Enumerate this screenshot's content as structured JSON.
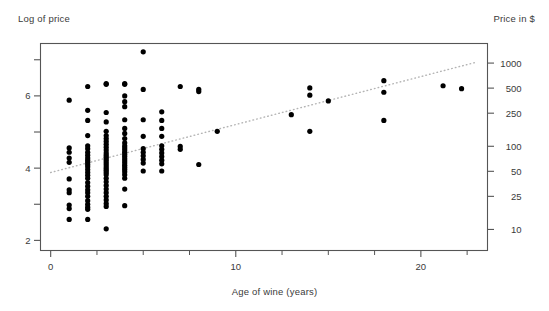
{
  "titles": {
    "left_axis_title": "Log of price",
    "right_axis_title": "Price in $",
    "x_axis_title": "Age of wine (years)"
  },
  "chart_data": {
    "type": "scatter",
    "title": "",
    "xlabel": "Age of wine (years)",
    "ylabel": "Log of price",
    "y2label": "Price in $",
    "xlim": [
      -0.55,
      23.6
    ],
    "ylim": [
      1.72,
      7.45
    ],
    "grid": false,
    "legend": "none",
    "xticks": [
      0,
      10,
      20
    ],
    "xtick_labels": [
      "0",
      "10",
      "20"
    ],
    "xticks_minor": [
      2.5,
      5,
      7.5,
      12.5,
      15,
      17.5,
      22.5
    ],
    "yticks": [
      2,
      3,
      4,
      5,
      6,
      7
    ],
    "ytick_labels": [
      "2",
      "",
      "4",
      "",
      "6",
      ""
    ],
    "y2ticks_log": [
      2.303,
      3.219,
      3.912,
      4.605,
      5.521,
      6.215,
      6.908
    ],
    "y2tick_labels": [
      "10",
      "25",
      "50",
      "100",
      "250",
      "500",
      "1000"
    ],
    "marker": "filled-circle",
    "marker_color": "#000000",
    "marker_size_px": 2.6,
    "trendline": {
      "style": "dotted",
      "color": "#b4b4b4",
      "x_start": 0.0,
      "y_start": 3.88,
      "x_end": 22.9,
      "y_end": 6.92
    },
    "points": [
      [
        1.0,
        5.88
      ],
      [
        1.0,
        4.56
      ],
      [
        1.0,
        4.44
      ],
      [
        1.0,
        4.28
      ],
      [
        1.0,
        4.16
      ],
      [
        1.0,
        3.7
      ],
      [
        1.0,
        3.4
      ],
      [
        1.0,
        3.32
      ],
      [
        1.0,
        2.98
      ],
      [
        1.0,
        2.88
      ],
      [
        1.0,
        2.58
      ],
      [
        2.0,
        6.26
      ],
      [
        2.0,
        5.6
      ],
      [
        2.0,
        5.32
      ],
      [
        2.0,
        4.9
      ],
      [
        2.0,
        4.62
      ],
      [
        2.0,
        4.54
      ],
      [
        2.0,
        4.44
      ],
      [
        2.0,
        4.36
      ],
      [
        2.0,
        4.28
      ],
      [
        2.0,
        4.22
      ],
      [
        2.0,
        4.16
      ],
      [
        2.0,
        4.1
      ],
      [
        2.0,
        4.04
      ],
      [
        2.0,
        3.96
      ],
      [
        2.0,
        3.88
      ],
      [
        2.0,
        3.8
      ],
      [
        2.0,
        3.72
      ],
      [
        2.0,
        3.6
      ],
      [
        2.0,
        3.5
      ],
      [
        2.0,
        3.4
      ],
      [
        2.0,
        3.32
      ],
      [
        2.0,
        3.22
      ],
      [
        2.0,
        3.1
      ],
      [
        2.0,
        3.0
      ],
      [
        2.0,
        2.92
      ],
      [
        2.0,
        2.86
      ],
      [
        2.0,
        2.58
      ],
      [
        3.0,
        6.34
      ],
      [
        3.0,
        6.32
      ],
      [
        3.0,
        5.54
      ],
      [
        3.0,
        5.28
      ],
      [
        3.0,
        5.02
      ],
      [
        3.0,
        4.9
      ],
      [
        3.0,
        4.82
      ],
      [
        3.0,
        4.74
      ],
      [
        3.0,
        4.66
      ],
      [
        3.0,
        4.58
      ],
      [
        3.0,
        4.5
      ],
      [
        3.0,
        4.42
      ],
      [
        3.0,
        4.36
      ],
      [
        3.0,
        4.3
      ],
      [
        3.0,
        4.24
      ],
      [
        3.0,
        4.18
      ],
      [
        3.0,
        4.12
      ],
      [
        3.0,
        4.06
      ],
      [
        3.0,
        4.0
      ],
      [
        3.0,
        3.94
      ],
      [
        3.0,
        3.88
      ],
      [
        3.0,
        3.82
      ],
      [
        3.0,
        3.72
      ],
      [
        3.0,
        3.62
      ],
      [
        3.0,
        3.52
      ],
      [
        3.0,
        3.42
      ],
      [
        3.0,
        3.32
      ],
      [
        3.0,
        3.22
      ],
      [
        3.0,
        3.12
      ],
      [
        3.0,
        3.02
      ],
      [
        3.0,
        2.94
      ],
      [
        3.0,
        2.32
      ],
      [
        4.0,
        6.34
      ],
      [
        4.0,
        6.32
      ],
      [
        4.0,
        6.0
      ],
      [
        4.0,
        5.84
      ],
      [
        4.0,
        5.7
      ],
      [
        4.0,
        5.34
      ],
      [
        4.0,
        5.1
      ],
      [
        4.0,
        4.96
      ],
      [
        4.0,
        4.82
      ],
      [
        4.0,
        4.7
      ],
      [
        4.0,
        4.62
      ],
      [
        4.0,
        4.56
      ],
      [
        4.0,
        4.5
      ],
      [
        4.0,
        4.44
      ],
      [
        4.0,
        4.38
      ],
      [
        4.0,
        4.32
      ],
      [
        4.0,
        4.26
      ],
      [
        4.0,
        4.2
      ],
      [
        4.0,
        4.14
      ],
      [
        4.0,
        4.08
      ],
      [
        4.0,
        4.02
      ],
      [
        4.0,
        3.96
      ],
      [
        4.0,
        3.9
      ],
      [
        4.0,
        3.82
      ],
      [
        4.0,
        3.72
      ],
      [
        4.0,
        3.42
      ],
      [
        4.0,
        2.96
      ],
      [
        5.0,
        7.22
      ],
      [
        5.0,
        6.18
      ],
      [
        5.0,
        5.34
      ],
      [
        5.0,
        4.88
      ],
      [
        5.0,
        4.54
      ],
      [
        5.0,
        4.44
      ],
      [
        5.0,
        4.34
      ],
      [
        5.0,
        4.24
      ],
      [
        5.0,
        4.14
      ],
      [
        5.0,
        3.92
      ],
      [
        6.0,
        5.56
      ],
      [
        6.0,
        5.32
      ],
      [
        6.0,
        5.1
      ],
      [
        6.0,
        4.88
      ],
      [
        6.0,
        4.62
      ],
      [
        6.0,
        4.52
      ],
      [
        6.0,
        4.42
      ],
      [
        6.0,
        4.32
      ],
      [
        6.0,
        4.22
      ],
      [
        6.0,
        4.12
      ],
      [
        6.0,
        3.92
      ],
      [
        7.0,
        6.26
      ],
      [
        7.0,
        4.6
      ],
      [
        7.0,
        4.52
      ],
      [
        8.0,
        6.18
      ],
      [
        8.0,
        6.12
      ],
      [
        8.0,
        4.1
      ],
      [
        9.0,
        5.02
      ],
      [
        13.0,
        5.48
      ],
      [
        14.0,
        6.22
      ],
      [
        14.0,
        6.02
      ],
      [
        14.0,
        5.02
      ],
      [
        15.0,
        5.86
      ],
      [
        18.0,
        6.42
      ],
      [
        18.0,
        6.1
      ],
      [
        18.0,
        5.32
      ],
      [
        21.2,
        6.28
      ],
      [
        22.2,
        6.2
      ]
    ]
  },
  "axis_style": {
    "frame_color": "#555555",
    "tick_color": "#555555",
    "text_color": "#3a3a3a",
    "background": "#ffffff"
  }
}
